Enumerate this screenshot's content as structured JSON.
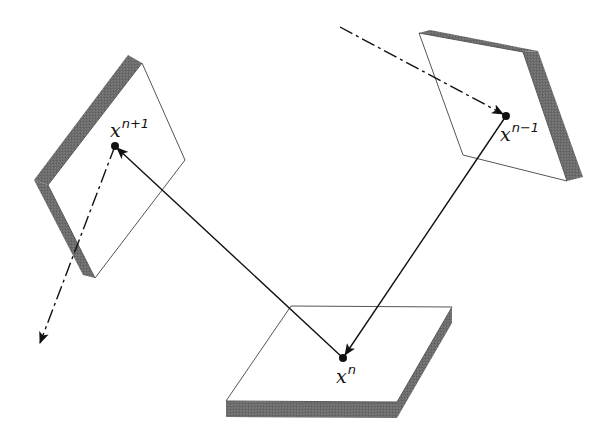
{
  "diagram": {
    "points": [
      {
        "id": "x_n_plus_1",
        "base": "x",
        "sup": "n+1",
        "x": 115,
        "y": 146
      },
      {
        "id": "x_n_minus_1",
        "base": "x",
        "sup": "n−1",
        "x": 506,
        "y": 116
      },
      {
        "id": "x_n",
        "base": "x",
        "sup": "n",
        "x": 343,
        "y": 358
      }
    ],
    "edges": [
      {
        "from": "x_n",
        "to": "x_n_plus_1",
        "style": "solid-arrow"
      },
      {
        "from": "x_n_minus_1",
        "to": "x_n",
        "style": "solid-arrow"
      },
      {
        "from": "offscreen-top",
        "to": "x_n_minus_1",
        "style": "dash-dot-arrow"
      },
      {
        "from": "x_n_plus_1",
        "to": "offscreen-bottom-left",
        "style": "dash-dot-arrow"
      }
    ],
    "colors": {
      "face": "#ffffff",
      "edge": "#555555",
      "thickness": "#6e6e6e",
      "line": "#111111"
    }
  }
}
